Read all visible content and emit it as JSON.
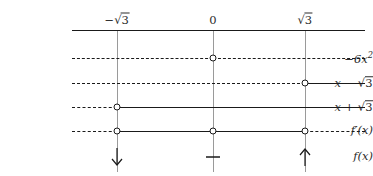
{
  "chart_data": {
    "type": "table",
    "title": "",
    "subtitle": "",
    "xlabel": "",
    "ylabel": "",
    "grid": false,
    "legend": "none",
    "critical_points": [
      {
        "id": "neg-sqrt3",
        "label": "-√3",
        "label_parts": {
          "sign": "−",
          "radical": "√",
          "radicand": "3"
        },
        "x_px": 117
      },
      {
        "id": "zero",
        "label": "0",
        "label_parts": {
          "sign": "",
          "radical": "",
          "radicand": ""
        },
        "x_px": 213
      },
      {
        "id": "pos-sqrt3",
        "label": "√3",
        "label_parts": {
          "sign": "",
          "radical": "√",
          "radicand": "3"
        },
        "x_px": 305
      }
    ],
    "axis": {
      "x_start_px": 72,
      "x_end_px": 365,
      "y_px": 30
    },
    "line_extent": {
      "x_start_px": 72,
      "x_end_px": 365
    },
    "rows": [
      {
        "id": "row-neg6x2",
        "label": "-6x²",
        "label_parts": {
          "base": "−6x",
          "exponent": "2",
          "radical": "",
          "radicand": ""
        },
        "y_px": 58,
        "segments": [
          {
            "from_px": 72,
            "to_px": 213,
            "style": "dashed",
            "sign": "negative"
          },
          {
            "from_px": 213,
            "to_px": 365,
            "style": "dashed",
            "sign": "negative"
          }
        ],
        "zeros_px": [
          213
        ]
      },
      {
        "id": "row-x-minus-sqrt3",
        "label": "x - √3",
        "label_parts": {
          "base": "x − ",
          "exponent": "",
          "radical": "√",
          "radicand": "3"
        },
        "y_px": 83,
        "segments": [
          {
            "from_px": 72,
            "to_px": 305,
            "style": "dashed",
            "sign": "negative"
          },
          {
            "from_px": 305,
            "to_px": 365,
            "style": "solid",
            "sign": "positive"
          }
        ],
        "zeros_px": [
          305
        ]
      },
      {
        "id": "row-x-plus-sqrt3",
        "label": "x + √3",
        "label_parts": {
          "base": "x + ",
          "exponent": "",
          "radical": "√",
          "radicand": "3"
        },
        "y_px": 107,
        "segments": [
          {
            "from_px": 72,
            "to_px": 117,
            "style": "dashed",
            "sign": "negative"
          },
          {
            "from_px": 117,
            "to_px": 365,
            "style": "solid",
            "sign": "positive"
          }
        ],
        "zeros_px": [
          117
        ]
      },
      {
        "id": "row-f-prime",
        "label": "f'(x)",
        "label_parts": {
          "base": "f′(x)",
          "exponent": "",
          "radical": "",
          "radicand": ""
        },
        "y_px": 131,
        "segments": [
          {
            "from_px": 72,
            "to_px": 117,
            "style": "dashed",
            "sign": "negative"
          },
          {
            "from_px": 117,
            "to_px": 305,
            "style": "solid",
            "sign": "positive"
          },
          {
            "from_px": 305,
            "to_px": 365,
            "style": "dashed",
            "sign": "negative"
          }
        ],
        "zeros_px": [
          117,
          213,
          305
        ]
      },
      {
        "id": "row-f",
        "label": "f(x)",
        "label_parts": {
          "base": "f(x)",
          "exponent": "",
          "radical": "",
          "radicand": ""
        },
        "y_px": 157,
        "segments": [],
        "zeros_px": []
      }
    ],
    "behaviour_markers": [
      {
        "id": "marker-neg-sqrt3",
        "at_px": 117,
        "y_px": 157,
        "glyph": "down-arrow",
        "meaning": "decreasing"
      },
      {
        "id": "marker-zero",
        "at_px": 213,
        "y_px": 157,
        "glyph": "horizontal-dash",
        "meaning": "no-change"
      },
      {
        "id": "marker-pos-sqrt3",
        "at_px": 305,
        "y_px": 157,
        "glyph": "up-arrow",
        "meaning": "increasing"
      }
    ],
    "vertical_lines": [
      {
        "at_px": 117,
        "y_top_px": 30,
        "y_bottom_px": 172
      },
      {
        "at_px": 213,
        "y_top_px": 30,
        "y_bottom_px": 172
      },
      {
        "at_px": 305,
        "y_top_px": 30,
        "y_bottom_px": 172
      }
    ],
    "label_column": {
      "right_edge_px": 66
    },
    "colors": {
      "ink": "#1a1a1a",
      "text": "#2b2b2b",
      "rule": "#9a9a9a",
      "background": "#ffffff"
    }
  }
}
